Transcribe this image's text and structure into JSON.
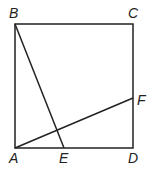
{
  "diagram": {
    "type": "geometry",
    "shape": "square ABCD with segments BE and AF",
    "points": {
      "A": {
        "label": "A",
        "x": 15,
        "y": 148
      },
      "B": {
        "label": "B",
        "x": 15,
        "y": 24
      },
      "C": {
        "label": "C",
        "x": 133,
        "y": 24
      },
      "D": {
        "label": "D",
        "x": 133,
        "y": 148
      },
      "E": {
        "label": "E",
        "x": 64,
        "y": 148
      },
      "F": {
        "label": "F",
        "x": 133,
        "y": 98
      }
    },
    "segments": [
      "AB",
      "BC",
      "CD",
      "DA",
      "BE",
      "AF"
    ],
    "colors": {
      "stroke": "#222222",
      "background": "#ffffff"
    }
  }
}
